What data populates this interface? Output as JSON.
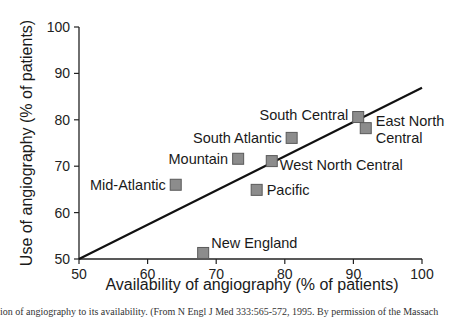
{
  "chart_data": {
    "type": "scatter",
    "title": "",
    "xlabel": "Availability of angiography (% of patients)",
    "ylabel": "Use of angiography (% of patients)",
    "xlim": [
      50,
      100
    ],
    "ylim": [
      50,
      100
    ],
    "x_ticks": [
      50,
      60,
      70,
      80,
      90,
      100
    ],
    "y_ticks": [
      50,
      60,
      70,
      80,
      90,
      100
    ],
    "grid": false,
    "legend": null,
    "points": [
      {
        "label": "Mid-Atlantic",
        "x": 64.1,
        "y": 66.0
      },
      {
        "label": "Mountain",
        "x": 73.2,
        "y": 71.6
      },
      {
        "label": "South Atlantic",
        "x": 81.0,
        "y": 76.1
      },
      {
        "label": "West North Central",
        "x": 78.1,
        "y": 71.1
      },
      {
        "label": "Pacific",
        "x": 75.9,
        "y": 64.9
      },
      {
        "label": "South Central",
        "x": 90.7,
        "y": 80.6
      },
      {
        "label": "East North Central",
        "x": 91.8,
        "y": 78.2
      },
      {
        "label": "New England",
        "x": 68.1,
        "y": 51.3
      }
    ],
    "trend_line": {
      "x": [
        50,
        100
      ],
      "y": [
        50,
        86.9
      ]
    },
    "marker": {
      "shape": "square",
      "fill": "#8c8c8c",
      "stroke": "#5a5a5a"
    }
  },
  "caption": "ion of angiography to its availability. (From N Engl J Med 333:565-572, 1995. By permission of the Massach"
}
